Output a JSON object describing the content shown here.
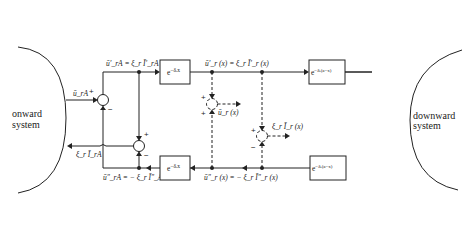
{
  "systems": {
    "left": [
      "onward",
      "system"
    ],
    "right": [
      "downward",
      "system"
    ]
  },
  "signals": {
    "u_in_A": "ūₙA",
    "u_rA_top": "ūₙA = ξₙ ĪₙA",
    "u_r_x_top": "ūₙ (x) = ξₙ Īₙ (x)",
    "u_rB_top": "ūₙB = ξₙ ĪₙB",
    "u_in_B": "ūₙB",
    "u_rA_bottom": "ūₙA = − ξₙ ĪₙA",
    "u_r_x_bottom": "ūₙ (x) = − ξₙ Īₙ (x)",
    "u_rB_bottom": "ūₙB = − ξₙ ĪₙB",
    "i_out_A": "ξₙ ĪₙA",
    "i_out_B": "ξₙ ĪₙB",
    "u_out_x": "ūₙ (x)",
    "i_out_x": "ξₙ Īₙ (x)"
  },
  "labels": {
    "u_in_A": "ū_rA",
    "u_rA_top": "ū′_rA = ξ_r Ī′_rA",
    "u_r_x_top": "ū′_r (x) = ξ_r Ī′_r (x)",
    "u_rB_top": "ū′_rB = ξ_r Ī′_B",
    "u_in_B": "ū_rB",
    "u_rA_bottom": "ū″_rA = − ξ_r Ī″_A",
    "u_r_x_bottom": "ū″_r (x) = − ξ_r Ī″_r (x)",
    "u_rB_bottom": "ū″_rB = − ξ_r Ī″_B",
    "i_out_A": "ξ_r Ī_rA",
    "i_out_B": "ξ_r Ī_rB",
    "u_out_x": "ū_r (x)",
    "i_out_x": "ξ_r Ī_r (x)"
  },
  "blocks": {
    "top_left": "e^{−δ_r x}",
    "top_right": "e^{−δ_r (a−x)}",
    "bottom_left": "e^{−δ_r x}",
    "bottom_right": "e^{−δ_r (a−x)}",
    "exp_base": "e",
    "exp_x": "−δₙx",
    "exp_ax": "−δₙ(a−x)"
  },
  "exponents": {
    "x": "−δᵣx",
    "ax": "−δᵣ(a−x)"
  },
  "axis_insets": {
    "zero": "0",
    "x": "x",
    "a": "a"
  },
  "signs": {
    "plus": "+",
    "minus": "−"
  }
}
